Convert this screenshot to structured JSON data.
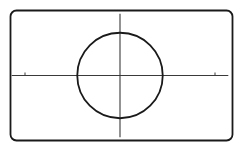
{
  "chart_data": {
    "type": "line",
    "title": "",
    "xlabel": "",
    "ylabel": "",
    "equation": "x^2 + y^2 = r^2",
    "circle": {
      "center": [
        0,
        0
      ],
      "radius": 0.45
    },
    "x_ticks": [
      -1,
      1
    ],
    "y_ticks": [],
    "xlim": [
      -1.14,
      1.14
    ],
    "ylim": [
      -0.65,
      0.65
    ],
    "grid": false,
    "legend": null,
    "colors": {
      "stroke": "#1a1a1a",
      "axis": "#3a3a3a",
      "frame": "#1a1a1a",
      "background": "#ffffff"
    }
  }
}
